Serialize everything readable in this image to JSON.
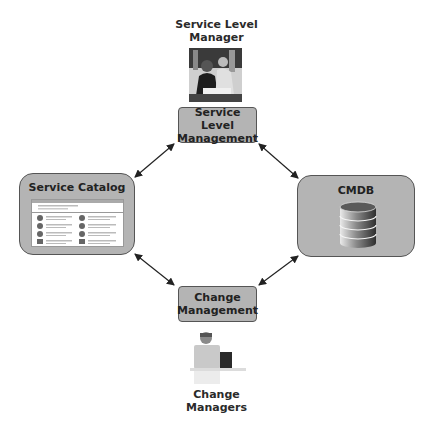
{
  "roles": {
    "top": {
      "label_line1": "Service Level",
      "label_line2": "Manager",
      "icon": "people-meeting-photo"
    },
    "bottom": {
      "label_line1": "Change",
      "label_line2": "Managers",
      "icon": "person-at-laptop-photo"
    }
  },
  "nodes": {
    "service_level_management": {
      "line1": "Service Level",
      "line2": "Management"
    },
    "change_management": {
      "line1": "Change",
      "line2": "Management"
    },
    "service_catalog": {
      "title": "Service Catalog",
      "icon": "catalog-screenshot"
    },
    "cmdb": {
      "title": "CMDB",
      "icon": "database-icon"
    }
  },
  "edges": [
    {
      "from": "service_level_management",
      "to": "service_catalog",
      "type": "bidirectional"
    },
    {
      "from": "service_level_management",
      "to": "cmdb",
      "type": "bidirectional"
    },
    {
      "from": "change_management",
      "to": "service_catalog",
      "type": "bidirectional"
    },
    {
      "from": "change_management",
      "to": "cmdb",
      "type": "bidirectional"
    }
  ],
  "colors": {
    "box_fill": "#b4b4b4",
    "box_border": "#555555",
    "arrow": "#222222"
  }
}
